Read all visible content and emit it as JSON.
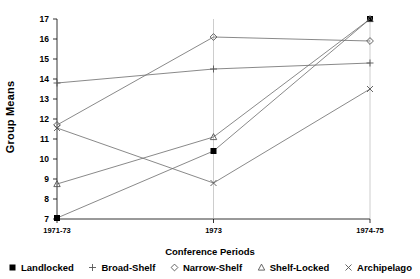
{
  "chart_data": {
    "type": "line",
    "title": "",
    "xlabel": "Conference Periods",
    "ylabel": "Group Means",
    "categories": [
      "1971-73",
      "1973",
      "1974-75"
    ],
    "ylim": [
      7,
      17
    ],
    "yticks": [
      7,
      8,
      9,
      10,
      11,
      12,
      13,
      14,
      15,
      16,
      17
    ],
    "grid": false,
    "legend_position": "bottom",
    "series": [
      {
        "name": "Landlocked",
        "marker": "filled-square",
        "values": [
          7.05,
          10.4,
          17.0
        ]
      },
      {
        "name": "Broad-Shelf",
        "marker": "plus",
        "values": [
          13.8,
          14.5,
          14.8
        ]
      },
      {
        "name": "Narrow-Shelf",
        "marker": "diamond",
        "values": [
          11.7,
          16.1,
          15.9
        ]
      },
      {
        "name": "Shelf-Locked",
        "marker": "triangle",
        "values": [
          8.75,
          11.1,
          17.0
        ]
      },
      {
        "name": "Archipelago",
        "marker": "cross",
        "values": [
          11.55,
          8.8,
          13.5
        ]
      }
    ]
  },
  "axis": {
    "ytick_labels": [
      "17",
      "16",
      "15",
      "14",
      "13",
      "12",
      "11",
      "10",
      "9",
      "8",
      "7"
    ],
    "xtick_labels": [
      "1971-73",
      "1973",
      "1974-75"
    ]
  },
  "legend": {
    "items": [
      {
        "label": "Landlocked",
        "marker": "filled-square"
      },
      {
        "label": "Broad-Shelf",
        "marker": "plus"
      },
      {
        "label": "Narrow-Shelf",
        "marker": "diamond"
      },
      {
        "label": "Shelf-Locked",
        "marker": "triangle"
      },
      {
        "label": "Archipelago",
        "marker": "cross"
      }
    ]
  },
  "colors": {
    "line": "#6b6b6b",
    "axis": "#000000",
    "marker": "#555555",
    "landlocked_marker": "#000000"
  }
}
